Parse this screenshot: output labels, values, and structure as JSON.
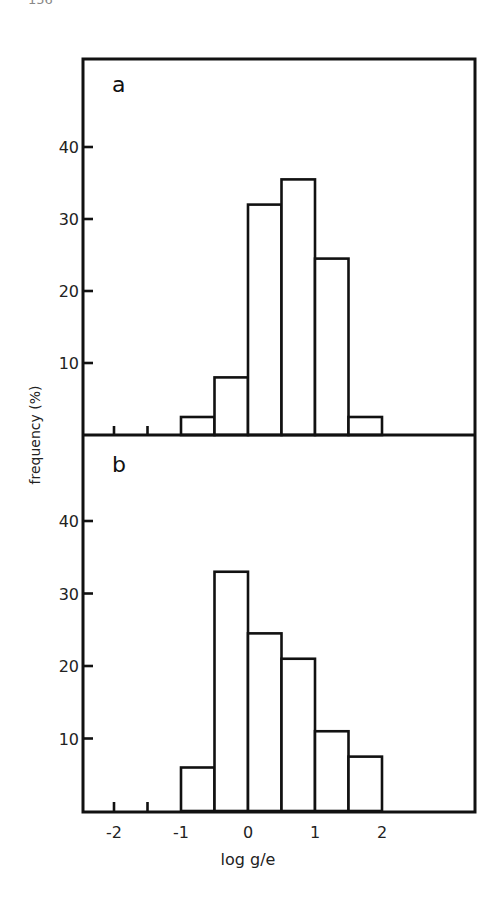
{
  "page": {
    "page_number_fragment": "156"
  },
  "figure": {
    "ylabel": "frequency (%)",
    "xlabel": "log g/e",
    "x_ticks": [
      {
        "value": -2,
        "label": "-2"
      },
      {
        "value": -1,
        "label": "-1"
      },
      {
        "value": 0,
        "label": "0"
      },
      {
        "value": 1,
        "label": "1"
      },
      {
        "value": 2,
        "label": "2"
      }
    ],
    "minor_ticks": [
      -2,
      -1.5
    ]
  },
  "chart_data": [
    {
      "type": "bar",
      "panel": "a",
      "title": "a",
      "xlabel": "log g/e",
      "ylabel": "frequency (%)",
      "bin_edges": [
        -1,
        -0.5,
        0,
        0.5,
        1,
        1.5,
        2
      ],
      "categories": [
        "-1 to -0.5",
        "-0.5 to 0",
        "0 to 0.5",
        "0.5 to 1",
        "1 to 1.5",
        "1.5 to 2"
      ],
      "values": [
        2.5,
        8,
        32,
        35.5,
        24.5,
        2.5
      ],
      "y_ticks": [
        10,
        20,
        30,
        40
      ],
      "ylim": [
        0,
        50
      ],
      "xlim": [
        -2.5,
        3.4
      ],
      "grid": false,
      "legend": null
    },
    {
      "type": "bar",
      "panel": "b",
      "title": "b",
      "xlabel": "log g/e",
      "ylabel": "frequency (%)",
      "bin_edges": [
        -1,
        -0.5,
        0,
        0.5,
        1,
        1.5,
        2
      ],
      "categories": [
        "-1 to -0.5",
        "-0.5 to 0",
        "0 to 0.5",
        "0.5 to 1",
        "1 to 1.5",
        "1.5 to 2"
      ],
      "values": [
        6,
        33,
        24.5,
        21,
        11,
        7.5
      ],
      "y_ticks": [
        10,
        20,
        30,
        40
      ],
      "ylim": [
        0,
        50
      ],
      "xlim": [
        -2.5,
        3.4
      ],
      "grid": false,
      "legend": null
    }
  ],
  "style": {
    "line_color": "#111111",
    "bar_fill": "#ffffff",
    "background": "#ffffff"
  }
}
